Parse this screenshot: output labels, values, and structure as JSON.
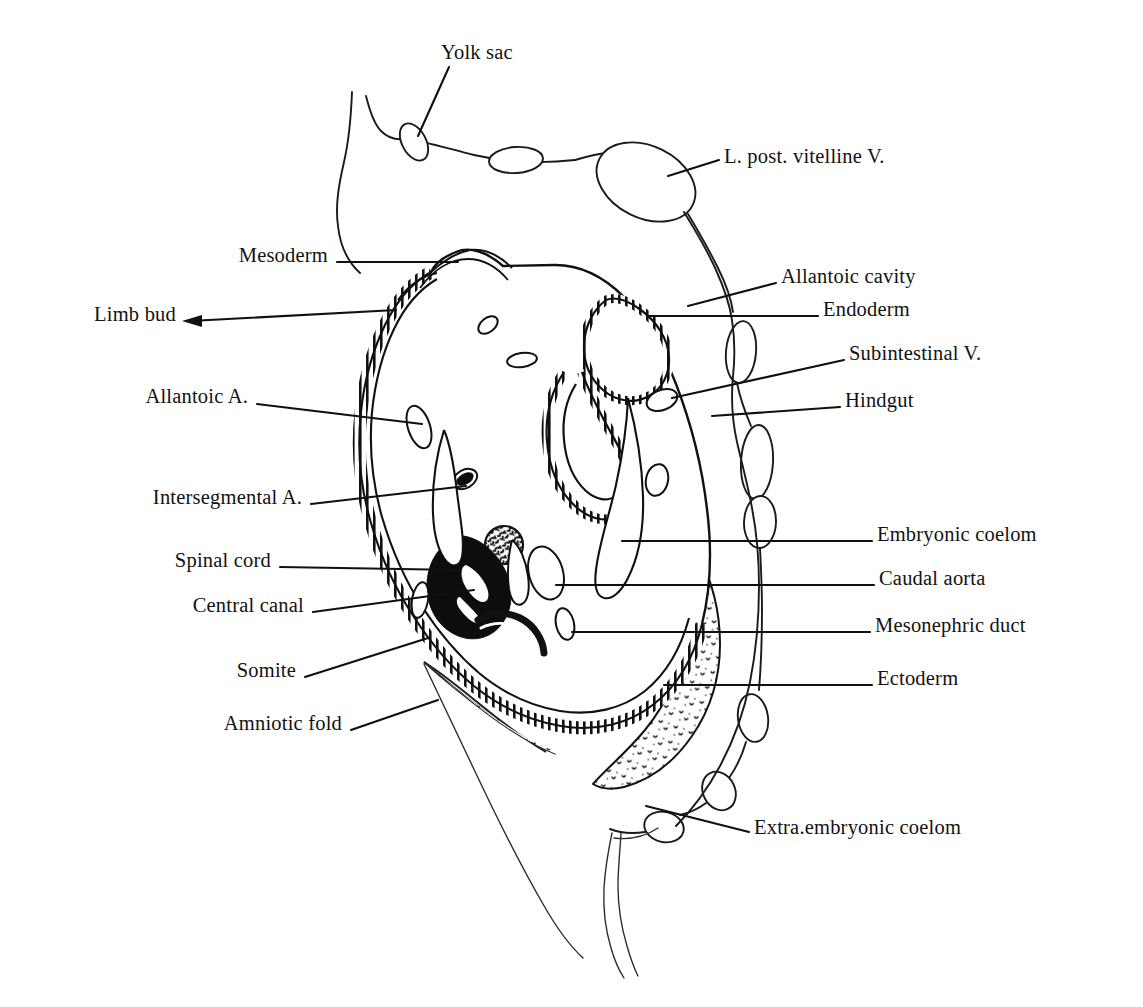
{
  "figure": {
    "background_color": "#ffffff",
    "ink_color": "#111111"
  },
  "labels": [
    {
      "id": "yolk-sac",
      "text": "Yolk sac",
      "side": "top",
      "x": 441,
      "y": 52,
      "anchor": "start"
    },
    {
      "id": "l-post-vitelline-v",
      "text": "L. post. vitelline V.",
      "side": "right",
      "x": 724,
      "y": 156,
      "anchor": "start"
    },
    {
      "id": "mesoderm",
      "text": "Mesoderm",
      "side": "left",
      "x": 328,
      "y": 255,
      "anchor": "end"
    },
    {
      "id": "allantoic-cavity",
      "text": "Allantoic cavity",
      "side": "right",
      "x": 781,
      "y": 276,
      "anchor": "start"
    },
    {
      "id": "endoderm",
      "text": "Endoderm",
      "side": "right",
      "x": 823,
      "y": 309,
      "anchor": "start"
    },
    {
      "id": "limb-bud",
      "text": "Limb bud",
      "side": "left",
      "x": 176,
      "y": 314,
      "anchor": "end"
    },
    {
      "id": "subintestinal-v",
      "text": "Subintestinal V.",
      "side": "right",
      "x": 849,
      "y": 353,
      "anchor": "start"
    },
    {
      "id": "allantoic-a",
      "text": "Allantoic A.",
      "side": "left",
      "x": 248,
      "y": 396,
      "anchor": "end"
    },
    {
      "id": "hindgut",
      "text": "Hindgut",
      "side": "right",
      "x": 845,
      "y": 400,
      "anchor": "start"
    },
    {
      "id": "intersegmental-a",
      "text": "Intersegmental A.",
      "side": "left",
      "x": 302,
      "y": 497,
      "anchor": "end"
    },
    {
      "id": "embryonic-coelom",
      "text": "Embryonic coelom",
      "side": "right",
      "x": 877,
      "y": 534,
      "anchor": "start"
    },
    {
      "id": "spinal-cord",
      "text": "Spinal cord",
      "side": "left",
      "x": 271,
      "y": 560,
      "anchor": "end"
    },
    {
      "id": "caudal-aorta",
      "text": "Caudal aorta",
      "side": "right",
      "x": 879,
      "y": 578,
      "anchor": "start"
    },
    {
      "id": "central-canal",
      "text": "Central canal",
      "side": "left",
      "x": 304,
      "y": 605,
      "anchor": "end"
    },
    {
      "id": "mesonephric-duct",
      "text": "Mesonephric duct",
      "side": "right",
      "x": 875,
      "y": 625,
      "anchor": "start"
    },
    {
      "id": "somite",
      "text": "Somite",
      "side": "left",
      "x": 296,
      "y": 670,
      "anchor": "end"
    },
    {
      "id": "ectoderm",
      "text": "Ectoderm",
      "side": "right",
      "x": 877,
      "y": 678,
      "anchor": "start"
    },
    {
      "id": "amniotic-fold",
      "text": "Amniotic fold",
      "side": "left",
      "x": 342,
      "y": 723,
      "anchor": "end"
    },
    {
      "id": "extra-embryonic-coelom",
      "text": "Extra.embryonic coelom",
      "side": "right",
      "x": 754,
      "y": 827,
      "anchor": "start"
    }
  ],
  "structures": [
    {
      "id": "spinal-cord",
      "kind": "solid-black-mass",
      "note": "neural tube, dorsal, solid black"
    },
    {
      "id": "central-canal",
      "kind": "slit-lumen",
      "note": "narrow white slit inside spinal cord"
    },
    {
      "id": "hindgut",
      "kind": "epithelial-tube",
      "note": "columnar epithelium lined lumen"
    },
    {
      "id": "allantoic-cavity",
      "kind": "epithelial-tube",
      "note": "endoderm lined cavity, dorsal right"
    },
    {
      "id": "caudal-aorta",
      "kind": "vessel-lumen"
    },
    {
      "id": "allantoic-a",
      "kind": "vessel-lumen"
    },
    {
      "id": "intersegmental-a",
      "kind": "vessel-lumen"
    },
    {
      "id": "subintestinal-v",
      "kind": "vessel-lumen"
    },
    {
      "id": "mesonephric-duct",
      "kind": "small-duct"
    },
    {
      "id": "somite",
      "kind": "mesodermal-block"
    },
    {
      "id": "limb-bud",
      "kind": "mesenchymal-bud"
    },
    {
      "id": "mesoderm",
      "kind": "stippled-mesenchyme"
    },
    {
      "id": "ectoderm",
      "kind": "hatched-border-epithelium"
    },
    {
      "id": "endoderm",
      "kind": "epithelial-lining"
    },
    {
      "id": "embryonic-coelom",
      "kind": "body-cavity-space"
    },
    {
      "id": "extra-embryonic-coelom",
      "kind": "outer-cavity-space"
    },
    {
      "id": "amniotic-fold",
      "kind": "thin-membrane-flap"
    },
    {
      "id": "yolk-sac",
      "kind": "thin-membrane"
    },
    {
      "id": "l-post-vitelline-v",
      "kind": "large-vessel-oval"
    }
  ]
}
